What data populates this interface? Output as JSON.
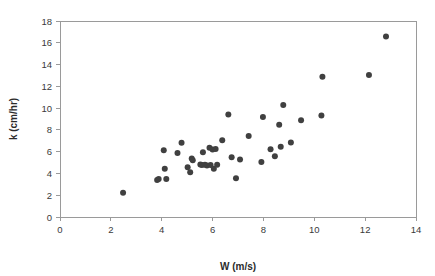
{
  "chart_data": {
    "type": "scatter",
    "title": "",
    "xlabel": "W (m/s)",
    "ylabel": "k (cm/hr)",
    "xlim": [
      0,
      14
    ],
    "ylim": [
      0,
      18
    ],
    "xticks": [
      0,
      2,
      4,
      6,
      8,
      10,
      12,
      14
    ],
    "yticks": [
      0,
      2,
      4,
      6,
      8,
      10,
      12,
      14,
      16,
      18
    ],
    "xtick_labels": [
      "0",
      "2",
      "4",
      "6",
      "8",
      "10",
      "12",
      "14"
    ],
    "ytick_labels": [
      "0",
      "2",
      "4",
      "6",
      "8",
      "10",
      "12",
      "14",
      "16",
      "18"
    ],
    "grid": false,
    "legend": null,
    "marker": {
      "shape": "circle",
      "color": "#404040",
      "size": 5.2
    },
    "series": [
      {
        "name": "k vs W",
        "points": [
          [
            2.48,
            2.22
          ],
          [
            3.82,
            3.4
          ],
          [
            3.88,
            3.48
          ],
          [
            4.08,
            6.12
          ],
          [
            4.12,
            4.42
          ],
          [
            4.18,
            3.5
          ],
          [
            4.62,
            5.88
          ],
          [
            4.78,
            6.82
          ],
          [
            5.02,
            4.58
          ],
          [
            5.12,
            4.12
          ],
          [
            5.18,
            5.38
          ],
          [
            5.22,
            5.22
          ],
          [
            5.52,
            4.82
          ],
          [
            5.58,
            4.78
          ],
          [
            5.62,
            5.95
          ],
          [
            5.7,
            4.8
          ],
          [
            5.78,
            4.72
          ],
          [
            5.88,
            6.35
          ],
          [
            5.92,
            4.78
          ],
          [
            6.0,
            6.2
          ],
          [
            6.05,
            4.42
          ],
          [
            6.12,
            6.25
          ],
          [
            6.18,
            4.8
          ],
          [
            6.38,
            7.05
          ],
          [
            6.62,
            9.42
          ],
          [
            6.75,
            5.48
          ],
          [
            6.92,
            3.55
          ],
          [
            7.08,
            5.28
          ],
          [
            7.42,
            7.45
          ],
          [
            7.92,
            5.05
          ],
          [
            7.98,
            9.18
          ],
          [
            8.28,
            6.22
          ],
          [
            8.45,
            5.58
          ],
          [
            8.62,
            8.48
          ],
          [
            8.68,
            6.45
          ],
          [
            8.78,
            10.28
          ],
          [
            9.08,
            6.85
          ],
          [
            9.48,
            8.88
          ],
          [
            10.28,
            9.32
          ],
          [
            10.32,
            12.88
          ],
          [
            12.15,
            13.05
          ],
          [
            12.82,
            16.58
          ]
        ]
      }
    ]
  },
  "axes": {
    "x_title": "W (m/s)",
    "y_title": "k (cm/hr)"
  }
}
